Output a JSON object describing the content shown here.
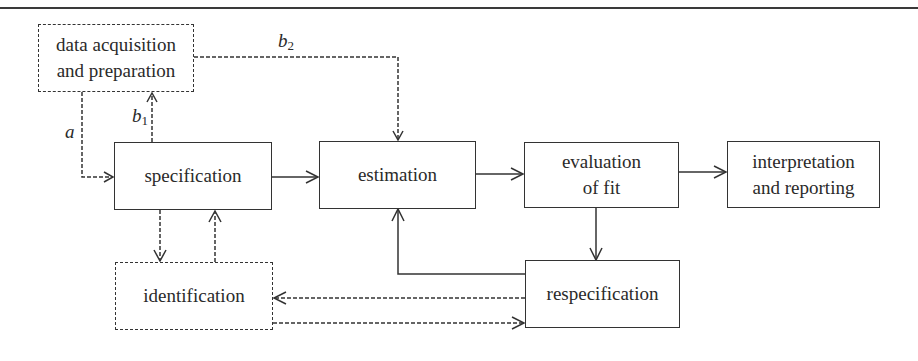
{
  "diagram": {
    "boxes": {
      "data": {
        "line1": "data acquisition",
        "line2": "and preparation",
        "style": "dashed"
      },
      "specification": {
        "label": "specification",
        "style": "solid"
      },
      "estimation": {
        "label": "estimation",
        "style": "solid"
      },
      "evaluation": {
        "line1": "evaluation",
        "line2": "of fit",
        "style": "solid"
      },
      "interpretation": {
        "line1": "interpretation",
        "line2": "and reporting",
        "style": "solid"
      },
      "identification": {
        "label": "identification",
        "style": "dashed"
      },
      "respecification": {
        "label": "respecification",
        "style": "solid"
      }
    },
    "edge_labels": {
      "a": "a",
      "b1_base": "b",
      "b1_sub": "1",
      "b2_base": "b",
      "b2_sub": "2"
    },
    "edges": [
      {
        "from": "data acquisition and preparation",
        "to": "specification",
        "label": "a",
        "style": "dashed"
      },
      {
        "from": "specification",
        "to": "data acquisition and preparation",
        "label": "b1",
        "style": "dashed"
      },
      {
        "from": "data acquisition and preparation",
        "to": "estimation",
        "label": "b2",
        "style": "dashed"
      },
      {
        "from": "specification",
        "to": "estimation",
        "style": "solid"
      },
      {
        "from": "estimation",
        "to": "evaluation of fit",
        "style": "solid"
      },
      {
        "from": "evaluation of fit",
        "to": "interpretation and reporting",
        "style": "solid"
      },
      {
        "from": "evaluation of fit",
        "to": "respecification",
        "style": "solid"
      },
      {
        "from": "respecification",
        "to": "estimation",
        "style": "solid"
      },
      {
        "from": "specification",
        "to": "identification",
        "style": "dashed"
      },
      {
        "from": "identification",
        "to": "specification",
        "style": "dashed"
      },
      {
        "from": "respecification",
        "to": "identification",
        "style": "dashed"
      },
      {
        "from": "identification",
        "to": "respecification",
        "style": "dashed"
      }
    ],
    "colors": {
      "line": "#333333",
      "text": "#2a2a2a",
      "background": "#ffffff"
    }
  }
}
